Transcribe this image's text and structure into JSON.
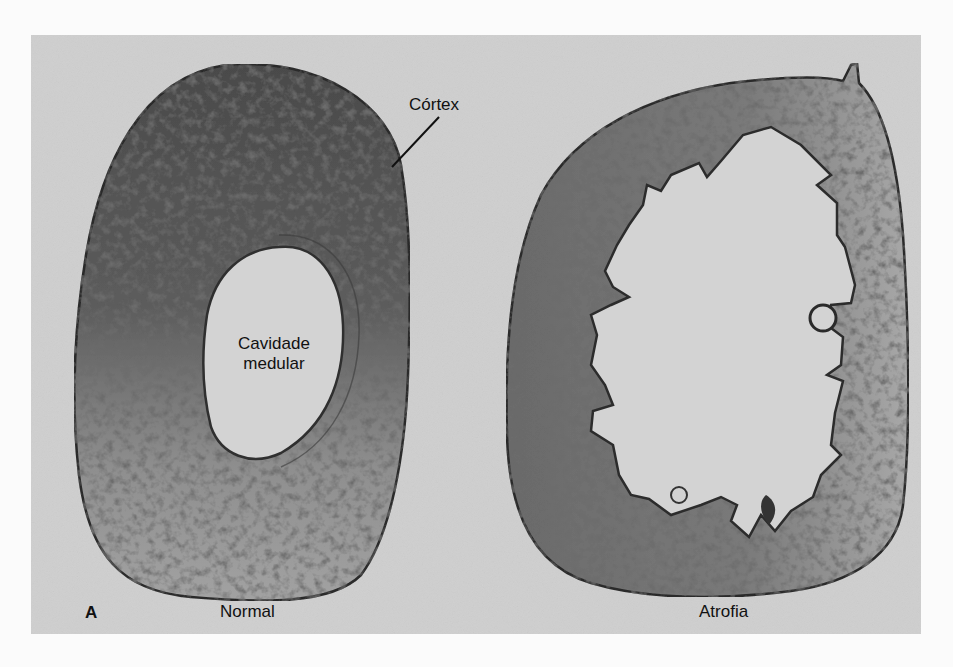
{
  "figure": {
    "panel_letter": "A",
    "sections": [
      {
        "id": "normal",
        "caption": "Normal"
      },
      {
        "id": "atrophy",
        "caption": "Atrofia"
      }
    ],
    "annotations": {
      "cortex": "Córtex",
      "medullary_cavity_line1": "Cavidade",
      "medullary_cavity_line2": "medular"
    },
    "colors": {
      "background": "#cfcfcf",
      "tissue_dark": "#3a3a3a",
      "tissue_mid": "#7a7a7a",
      "cavity": "#d6d6d6",
      "page": "#fbfbfb"
    }
  }
}
